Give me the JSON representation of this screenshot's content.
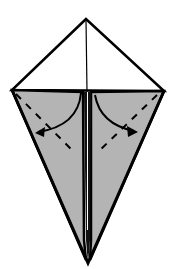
{
  "diagram": {
    "type": "origami-fold-step",
    "colors": {
      "paper_front": "#ffffff",
      "paper_back": "#b4b4b4",
      "outline": "#000000"
    },
    "points": {
      "top": [
        86,
        19
      ],
      "left": [
        12,
        90
      ],
      "right": [
        164,
        91
      ],
      "bottom": [
        88,
        262
      ]
    },
    "arrows": [
      {
        "name": "left-flap-fold-arrow",
        "direction": "down-left"
      },
      {
        "name": "right-flap-fold-arrow",
        "direction": "down-right"
      }
    ]
  }
}
